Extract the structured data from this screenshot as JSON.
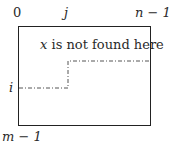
{
  "diagram": {
    "type": "matrix-search-region",
    "top_labels": {
      "left": "0",
      "middle": "j",
      "right": "n − 1"
    },
    "side_labels": {
      "row": "i",
      "bottom": "m − 1"
    },
    "annotation": {
      "var": "x",
      "rest": " is not found here"
    },
    "staircase": {
      "style": "dash-dot",
      "color": "#555555",
      "points": [
        [
          19,
          88
        ],
        [
          68,
          88
        ],
        [
          68,
          61
        ],
        [
          149,
          61
        ]
      ]
    },
    "box_color": "#222222"
  }
}
